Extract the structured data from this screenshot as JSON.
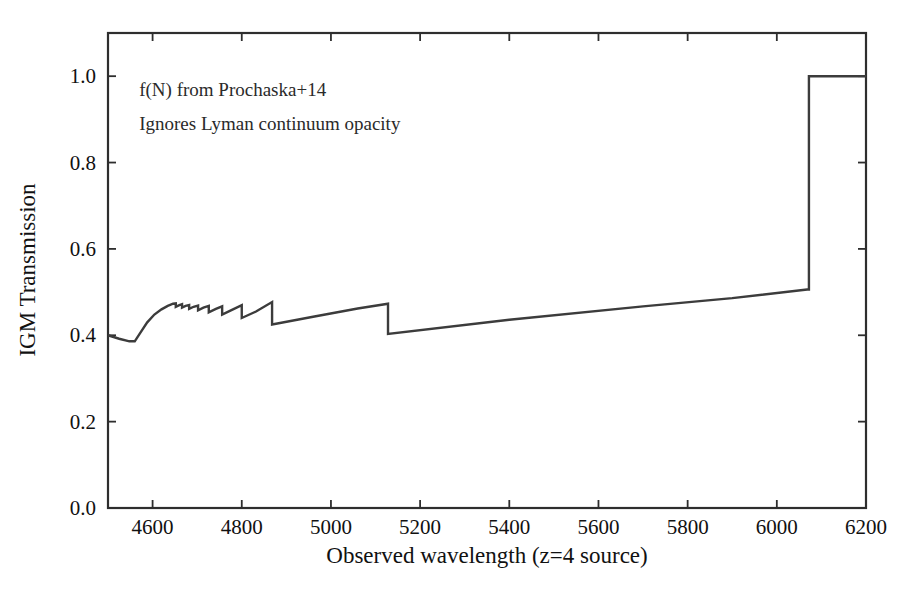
{
  "figure": {
    "width": 915,
    "height": 604,
    "background": "#ffffff",
    "line_color": "#3c3c3c",
    "axis_color": "#2e2e2e",
    "text_color": "#111111"
  },
  "annotations": [
    {
      "text": "f(N) from Prochaska+14",
      "x": 4570,
      "y": 0.955
    },
    {
      "text": "Ignores Lyman continuum opacity",
      "x": 4570,
      "y": 0.875
    }
  ],
  "chart_data": {
    "type": "line",
    "title": "",
    "xlabel": "Observed wavelength (z=4 source)",
    "ylabel": "IGM Transmission",
    "xlim": [
      4500,
      6200
    ],
    "ylim": [
      0.0,
      1.1
    ],
    "xticks": [
      4600,
      4800,
      5000,
      5200,
      5400,
      5600,
      5800,
      6000,
      6200
    ],
    "xticklabels": [
      "4600",
      "4800",
      "5000",
      "5200",
      "5400",
      "5600",
      "5800",
      "6000",
      "6200"
    ],
    "yticks": [
      0.0,
      0.2,
      0.4,
      0.6,
      0.8,
      1.0
    ],
    "yticklabels": [
      "0.0",
      "0.2",
      "0.4",
      "0.6",
      "0.8",
      "1.0"
    ],
    "grid": false,
    "legend": null,
    "series": [
      {
        "name": "IGM transmission (z=4 source)",
        "color": "#3c3c3c",
        "linewidth": 2.4,
        "x": [
          4500,
          4525,
          4548,
          4560,
          4572,
          4588,
          4604,
          4620,
          4634,
          4646,
          4652,
          4652,
          4660,
          4666,
          4666,
          4674,
          4682,
          4682,
          4692,
          4702,
          4702,
          4714,
          4726,
          4726,
          4742,
          4756,
          4756,
          4778,
          4800,
          4800,
          4832,
          4868,
          4868,
          4960,
          5060,
          5128,
          5128,
          5400,
          5700,
          5900,
          6068,
          6072,
          6072,
          6200
        ],
        "y": [
          0.4,
          0.392,
          0.386,
          0.386,
          0.405,
          0.43,
          0.448,
          0.46,
          0.468,
          0.473,
          0.474,
          0.466,
          0.47,
          0.472,
          0.464,
          0.468,
          0.47,
          0.461,
          0.466,
          0.469,
          0.458,
          0.464,
          0.468,
          0.453,
          0.461,
          0.467,
          0.448,
          0.459,
          0.47,
          0.44,
          0.455,
          0.477,
          0.425,
          0.443,
          0.462,
          0.473,
          0.403,
          0.436,
          0.467,
          0.486,
          0.506,
          0.506,
          1.0,
          1.0
        ]
      }
    ],
    "features": [
      {
        "name": "Lyman series converging steps",
        "range": [
          4640,
          4800
        ]
      },
      {
        "name": "Ly-gamma break",
        "wavelength": 4800
      },
      {
        "name": "Ly-beta break",
        "wavelength": 4868
      },
      {
        "name": "Ly-alpha break",
        "wavelength": 5128
      },
      {
        "name": "Ly-alpha of source (full transmission beyond)",
        "wavelength": 6072
      }
    ]
  }
}
